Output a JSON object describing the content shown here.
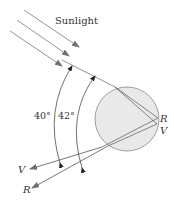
{
  "diagram": {
    "labels": {
      "sunlight": "Sunlight",
      "angle_violet": "40°",
      "angle_red": "42°",
      "drop_red": "R",
      "drop_violet": "V",
      "out_violet": "V",
      "out_red": "R"
    },
    "colors": {
      "ray": "#6e6e6e",
      "drop_fill": "#e9e9e9",
      "drop_stroke": "#8a8a8a",
      "text": "#333333"
    }
  }
}
